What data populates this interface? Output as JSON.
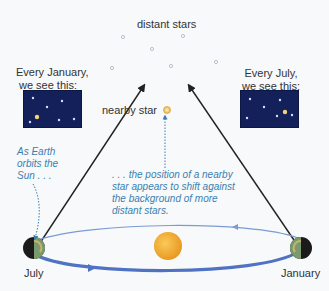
{
  "labels": {
    "distant_stars": "distant stars",
    "nearby_star": "nearby star",
    "january_view_line1": "Every January,",
    "january_view_line2": "we see this:",
    "july_view_line1": "Every July,",
    "july_view_line2": "we see this:",
    "earth_orbit_note_line1": "As Earth",
    "earth_orbit_note_line2": "orbits the",
    "earth_orbit_note_line3": "Sun . . .",
    "shift_note_line1": ". . . the position of a nearby",
    "shift_note_line2": "star appears to shift against",
    "shift_note_line3": "the background of more",
    "shift_note_line4": "distant stars.",
    "july": "July",
    "january": "January"
  },
  "colors": {
    "background": "#f7f9fb",
    "inset_sky": "#13205a",
    "orbit": "#5b7fc4",
    "sun": "#f0a830",
    "note_text": "#3a7fb0",
    "nearby_star": "#f3d27a"
  }
}
